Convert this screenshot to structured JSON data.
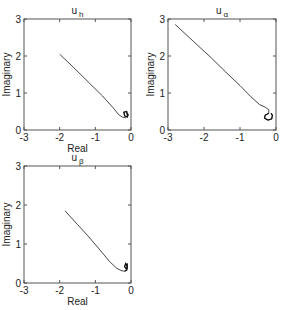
{
  "chart_data": [
    {
      "type": "line",
      "title": "u_h",
      "title_main": "u",
      "title_sub": "h",
      "xlabel": "Real",
      "ylabel": "Imaginary",
      "xlim": [
        -3,
        0
      ],
      "ylim": [
        0,
        3
      ],
      "xticks": [
        "-3",
        "-2",
        "-1",
        "0"
      ],
      "yticks": [
        "0",
        "1",
        "2",
        "3"
      ],
      "grid": false,
      "series": [
        {
          "name": "u_h locus",
          "x": [
            -2.0,
            -1.6,
            -1.2,
            -0.8,
            -0.5,
            -0.35,
            -0.25,
            -0.15,
            -0.1,
            -0.12,
            -0.2,
            -0.18,
            -0.1,
            -0.08,
            -0.12
          ],
          "y": [
            2.05,
            1.68,
            1.3,
            0.92,
            0.6,
            0.42,
            0.35,
            0.33,
            0.4,
            0.5,
            0.48,
            0.38,
            0.35,
            0.42,
            0.45
          ]
        }
      ]
    },
    {
      "type": "line",
      "title": "u_α",
      "title_main": "u",
      "title_sub": "α",
      "xlabel": "",
      "ylabel": "Imaginary",
      "xlim": [
        -3,
        0
      ],
      "ylim": [
        0,
        3
      ],
      "xticks": [
        "-3",
        "-2",
        "-1",
        "0"
      ],
      "yticks": [
        "0",
        "1",
        "2",
        "3"
      ],
      "grid": false,
      "series": [
        {
          "name": "u_α locus",
          "x": [
            -2.8,
            -2.3,
            -1.8,
            -1.4,
            -1.0,
            -0.7,
            -0.45,
            -0.3,
            -0.2,
            -0.2,
            -0.3,
            -0.32,
            -0.22,
            -0.12,
            -0.1,
            -0.14
          ],
          "y": [
            2.85,
            2.4,
            1.95,
            1.57,
            1.2,
            0.9,
            0.68,
            0.62,
            0.55,
            0.45,
            0.4,
            0.32,
            0.27,
            0.3,
            0.4,
            0.45
          ]
        }
      ]
    },
    {
      "type": "line",
      "title": "u_β",
      "title_main": "u",
      "title_sub": "β",
      "xlabel": "Real",
      "ylabel": "Imaginary",
      "xlim": [
        -3,
        0
      ],
      "ylim": [
        0,
        3
      ],
      "xticks": [
        "-3",
        "-2",
        "-1",
        "0"
      ],
      "yticks": [
        "0",
        "1",
        "2",
        "3"
      ],
      "grid": false,
      "series": [
        {
          "name": "u_β locus",
          "x": [
            -1.85,
            -1.5,
            -1.2,
            -0.9,
            -0.6,
            -0.4,
            -0.28,
            -0.18,
            -0.12,
            -0.1,
            -0.15,
            -0.18,
            -0.12,
            -0.1
          ],
          "y": [
            1.85,
            1.5,
            1.2,
            0.88,
            0.55,
            0.38,
            0.32,
            0.3,
            0.33,
            0.42,
            0.5,
            0.42,
            0.35,
            0.5
          ]
        }
      ]
    }
  ],
  "layout": {
    "plots": [
      {
        "x0": 24,
        "y0": 19,
        "x1": 131,
        "y1": 130
      },
      {
        "x0": 168,
        "y0": 19,
        "x1": 276,
        "y1": 130
      },
      {
        "x0": 24,
        "y0": 166,
        "x1": 131,
        "y1": 283
      }
    ]
  }
}
